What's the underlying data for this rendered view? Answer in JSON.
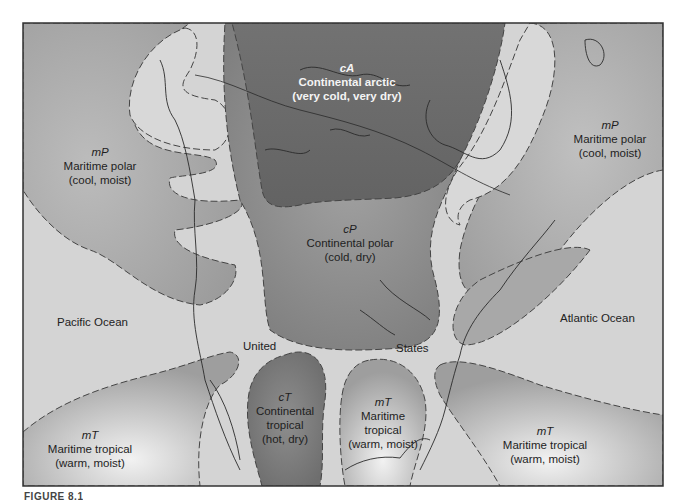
{
  "figure": {
    "caption_partial": "FIGURE 8.1",
    "frame": {
      "x": 23,
      "y": 23,
      "width": 640,
      "height": 463
    }
  },
  "colors": {
    "ocean": "#d3d3d3",
    "continental_arctic": "#6e6e6e",
    "continental_polar": "#8a8a8a",
    "maritime_polar": "#a6a6a6",
    "maritime_tropical": "#bdbdbd",
    "continental_tropical": "#7f7f7f",
    "land_light": "#d9d9d9",
    "coastline": "#2a2a2a",
    "boundary_dash": "#444444"
  },
  "air_masses": [
    {
      "id": "cA",
      "code": "cA",
      "name": "Continental arctic",
      "props": "(very cold, very dry)"
    },
    {
      "id": "cP",
      "code": "cP",
      "name": "Continental polar",
      "props": "(cold, dry)"
    },
    {
      "id": "mP-pacific",
      "code": "mP",
      "name": "Maritime polar",
      "props": "(cool, moist)"
    },
    {
      "id": "mP-atlantic",
      "code": "mP",
      "name": "Maritime polar",
      "props": "(cool, moist)"
    },
    {
      "id": "mT-pacific",
      "code": "mT",
      "name": "Maritime tropical",
      "props": "(warm, moist)"
    },
    {
      "id": "cT",
      "code": "cT",
      "name1": "Continental",
      "name2": "tropical",
      "props": "(hot, dry)"
    },
    {
      "id": "mT-gulf",
      "code": "mT",
      "name1": "Maritime",
      "name2": "tropical",
      "props": "(warm, moist)"
    },
    {
      "id": "mT-atlantic",
      "code": "mT",
      "name": "Maritime tropical",
      "props": "(warm, moist)"
    }
  ],
  "places": {
    "pacific": "Pacific Ocean",
    "atlantic": "Atlantic Ocean",
    "united": "United",
    "states": "States"
  }
}
